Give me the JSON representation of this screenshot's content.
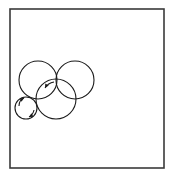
{
  "diagram": {
    "frame": {
      "x": 10,
      "y": 9,
      "width": 154,
      "height": 159,
      "stroke": "#3a3a3a",
      "stroke_width": 1.6
    },
    "circles": [
      {
        "id": "circle-upper-left",
        "cx": 38,
        "cy": 80,
        "r": 19
      },
      {
        "id": "circle-upper-right",
        "cx": 75,
        "cy": 80,
        "r": 19
      },
      {
        "id": "circle-middle",
        "cx": 56,
        "cy": 99,
        "r": 20
      },
      {
        "id": "circle-small",
        "cx": 26,
        "cy": 108,
        "r": 11
      }
    ],
    "arrows": [
      {
        "id": "arrow-small-upper",
        "path": "M 19 106 Q 19 100 24 98",
        "head": [
          24,
          98
        ],
        "angle": -30
      },
      {
        "id": "arrow-small-lower",
        "path": "M 34 110 Q 33 115 29 117",
        "head": [
          29,
          117
        ],
        "angle": 150
      },
      {
        "id": "arrow-middle-top",
        "path": "M 54 82 Q 48 83 45 88",
        "head": [
          45,
          88
        ],
        "angle": 120
      }
    ],
    "stroke_color": "#1a1a1a"
  }
}
